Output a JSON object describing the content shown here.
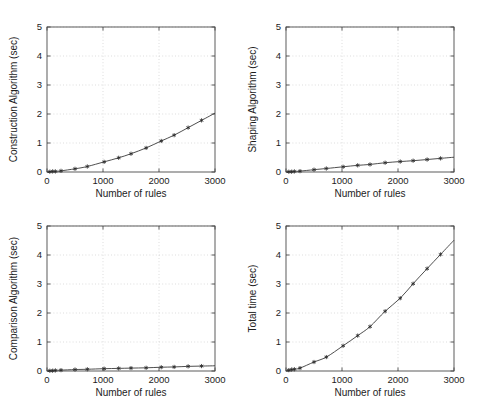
{
  "figure": {
    "background": "#ffffff",
    "layout": "2x2 subplot grid",
    "axis_color": "#4a4a4a",
    "grid_color": "#cfcfcf",
    "marker_color": "#2b2b2b",
    "curve_color": "#3a3a3a"
  },
  "chart_data": [
    {
      "type": "line",
      "id": "construction",
      "title": "",
      "xlabel": "Number of rules",
      "ylabel": "Construction Algorithm (sec)",
      "xlim": [
        0,
        3000
      ],
      "ylim": [
        0,
        5
      ],
      "xticks": [
        0,
        1000,
        2000,
        3000
      ],
      "xticklabels": [
        "0",
        "1000",
        "2000",
        "3000"
      ],
      "yticks": [
        0,
        1,
        2,
        3,
        4,
        5
      ],
      "yticklabels": [
        "0",
        "1",
        "2",
        "3",
        "4",
        "5"
      ],
      "grid": true,
      "legend": "none",
      "marker": "star",
      "x": [
        50,
        100,
        150,
        250,
        500,
        720,
        1020,
        1280,
        1500,
        1770,
        2040,
        2270,
        2520,
        2760
      ],
      "y": [
        0.01,
        0.02,
        0.02,
        0.04,
        0.11,
        0.19,
        0.35,
        0.49,
        0.63,
        0.83,
        1.07,
        1.27,
        1.53,
        1.78
      ]
    },
    {
      "type": "line",
      "id": "shaping",
      "title": "",
      "xlabel": "Number of rules",
      "ylabel": "Shaping Algorithm (sec)",
      "xlim": [
        0,
        3000
      ],
      "ylim": [
        0,
        5
      ],
      "xticks": [
        0,
        1000,
        2000,
        3000
      ],
      "xticklabels": [
        "0",
        "1000",
        "2000",
        "3000"
      ],
      "yticks": [
        0,
        1,
        2,
        3,
        4,
        5
      ],
      "yticklabels": [
        "0",
        "1",
        "2",
        "3",
        "4",
        "5"
      ],
      "grid": true,
      "legend": "none",
      "marker": "star",
      "x": [
        50,
        100,
        150,
        250,
        500,
        720,
        1020,
        1280,
        1500,
        1770,
        2040,
        2270,
        2520,
        2760
      ],
      "y": [
        0.01,
        0.01,
        0.02,
        0.03,
        0.08,
        0.12,
        0.18,
        0.23,
        0.26,
        0.32,
        0.36,
        0.39,
        0.43,
        0.47
      ]
    },
    {
      "type": "line",
      "id": "comparison",
      "title": "",
      "xlabel": "Number of rules",
      "ylabel": "Comparison Algorithm (sec)",
      "xlim": [
        0,
        3000
      ],
      "ylim": [
        0,
        5
      ],
      "xticks": [
        0,
        1000,
        2000,
        3000
      ],
      "xticklabels": [
        "0",
        "1000",
        "2000",
        "3000"
      ],
      "yticks": [
        0,
        1,
        2,
        3,
        4,
        5
      ],
      "yticklabels": [
        "0",
        "1",
        "2",
        "3",
        "4",
        "5"
      ],
      "grid": true,
      "legend": "none",
      "marker": "star",
      "x": [
        50,
        100,
        150,
        250,
        500,
        720,
        1020,
        1280,
        1500,
        1770,
        2040,
        2270,
        2520,
        2760
      ],
      "y": [
        0.01,
        0.01,
        0.02,
        0.03,
        0.05,
        0.06,
        0.08,
        0.09,
        0.1,
        0.11,
        0.13,
        0.14,
        0.16,
        0.17
      ]
    },
    {
      "type": "line",
      "id": "total",
      "title": "",
      "xlabel": "Number of rules",
      "ylabel": "Total time (sec)",
      "xlim": [
        0,
        3000
      ],
      "ylim": [
        0,
        5
      ],
      "xticks": [
        0,
        1000,
        2000,
        3000
      ],
      "xticklabels": [
        "0",
        "1000",
        "2000",
        "3000"
      ],
      "yticks": [
        0,
        1,
        2,
        3,
        4,
        5
      ],
      "yticklabels": [
        "0",
        "1",
        "2",
        "3",
        "4",
        "5"
      ],
      "grid": true,
      "legend": "none",
      "marker": "star",
      "x": [
        50,
        100,
        150,
        250,
        500,
        720,
        1020,
        1280,
        1500,
        1770,
        2040,
        2270,
        2520,
        2760
      ],
      "y": [
        0.03,
        0.05,
        0.06,
        0.1,
        0.31,
        0.48,
        0.87,
        1.22,
        1.53,
        2.06,
        2.51,
        3.01,
        3.53,
        4.02
      ]
    }
  ]
}
